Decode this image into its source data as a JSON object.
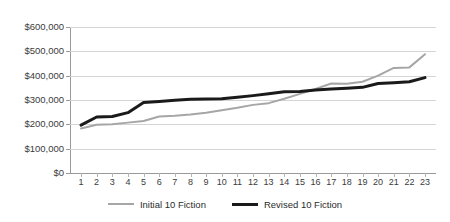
{
  "chart_data": {
    "type": "line",
    "title": "",
    "subtitle": "",
    "xlabel": "",
    "ylabel": "",
    "grid": true,
    "legend_position": "bottom",
    "ylim": [
      0,
      600000
    ],
    "y_ticks": [
      0,
      100000,
      200000,
      300000,
      400000,
      500000,
      600000
    ],
    "y_tick_labels": [
      "$0",
      "$100,000",
      "$200,000",
      "$300,000",
      "$400,000",
      "$500,000",
      "$600,000"
    ],
    "categories": [
      1,
      2,
      3,
      4,
      5,
      6,
      7,
      8,
      9,
      10,
      11,
      12,
      13,
      14,
      15,
      16,
      17,
      18,
      19,
      20,
      21,
      22,
      23
    ],
    "x_tick_labels": [
      "1",
      "2",
      "3",
      "4",
      "5",
      "6",
      "7",
      "8",
      "9",
      "10",
      "11",
      "12",
      "13",
      "14",
      "15",
      "16",
      "17",
      "18",
      "19",
      "20",
      "21",
      "22",
      "23"
    ],
    "series": [
      {
        "name": "Initial 10 Fiction",
        "color": "#a6a6a6",
        "width": 2,
        "values": [
          183000,
          198000,
          200000,
          207000,
          214000,
          232000,
          235000,
          240000,
          248000,
          258000,
          268000,
          280000,
          287000,
          305000,
          325000,
          345000,
          368000,
          367000,
          375000,
          400000,
          432000,
          434000,
          488000
        ]
      },
      {
        "name": "Revised 10 Fiction",
        "color": "#1a1a1a",
        "width": 3,
        "values": [
          197000,
          230000,
          232000,
          248000,
          290000,
          294000,
          299000,
          303000,
          304000,
          305000,
          311000,
          318000,
          326000,
          334000,
          335000,
          341000,
          345000,
          348000,
          352000,
          368000,
          371000,
          375000,
          392000
        ]
      }
    ]
  },
  "legend": {
    "entries": [
      {
        "label": "Initial 10 Fiction",
        "color": "#a6a6a6",
        "width": 2
      },
      {
        "label": "Revised 10 Fiction",
        "color": "#1a1a1a",
        "width": 3
      }
    ]
  },
  "colors": {
    "background": "#ffffff",
    "gridline": "#d5d5d5",
    "axis": "#9a9a9a",
    "text": "#3b3b3b",
    "series_initial": "#a6a6a6",
    "series_revised": "#1a1a1a"
  }
}
